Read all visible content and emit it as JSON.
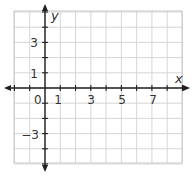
{
  "diagram": {
    "type": "coordinate-plane",
    "axes": {
      "x_label": "x",
      "y_label": "y"
    },
    "grid": {
      "x_min": -2,
      "x_max": 9,
      "y_min": -5,
      "y_max": 5,
      "step": 1
    },
    "x_tick_labels": [
      {
        "value": 1,
        "text": "1"
      },
      {
        "value": 3,
        "text": "3"
      },
      {
        "value": 5,
        "text": "5"
      },
      {
        "value": 7,
        "text": "7"
      }
    ],
    "y_tick_labels": [
      {
        "value": 3,
        "text": "3"
      },
      {
        "value": 1,
        "text": "1"
      },
      {
        "value": -3,
        "text": "−3"
      }
    ],
    "origin_label": "0",
    "colors": {
      "grid": "#d6d6d6",
      "border": "#cfcfcf",
      "axis": "#231f20",
      "text": "#333333"
    }
  }
}
